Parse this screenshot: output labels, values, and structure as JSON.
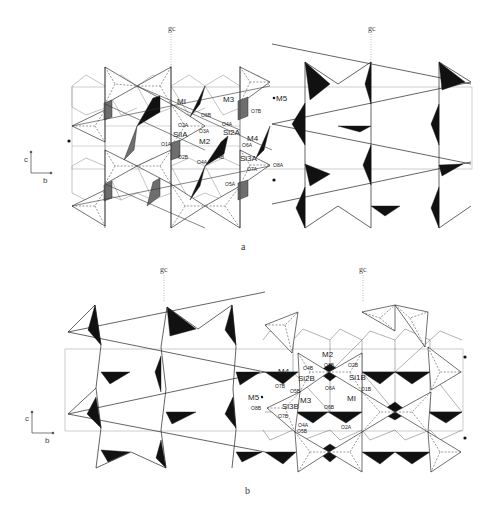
{
  "figure": {
    "panels": [
      {
        "id": "a",
        "caption": "a",
        "glide_labels": [
          "gc",
          "gc"
        ],
        "axes": {
          "vertical": "c",
          "horizontal": "b"
        },
        "site_labels": [
          "MI",
          "M3",
          "M5",
          "M2",
          "M4",
          "SiIA",
          "Si2A",
          "Si3A"
        ],
        "atom_labels": [
          "O2A",
          "O3A",
          "O4A",
          "O1A",
          "O2B",
          "O4B",
          "O6B",
          "O7B",
          "O6A",
          "O7A",
          "O8A",
          "O5A",
          "O4A"
        ]
      },
      {
        "id": "b",
        "caption": "b",
        "glide_labels": [
          "gc",
          "gc"
        ],
        "axes": {
          "vertical": "c",
          "horizontal": "b"
        },
        "site_labels": [
          "M4",
          "M2",
          "M3",
          "MI",
          "M5",
          "Si2B",
          "Si1B",
          "Si3B"
        ],
        "atom_labels": [
          "O4B",
          "O3B",
          "O2B",
          "O7B",
          "O5B",
          "O6A",
          "O1B",
          "O8B",
          "O7B",
          "O6B",
          "O4A",
          "O5B",
          "O2A"
        ]
      }
    ]
  }
}
